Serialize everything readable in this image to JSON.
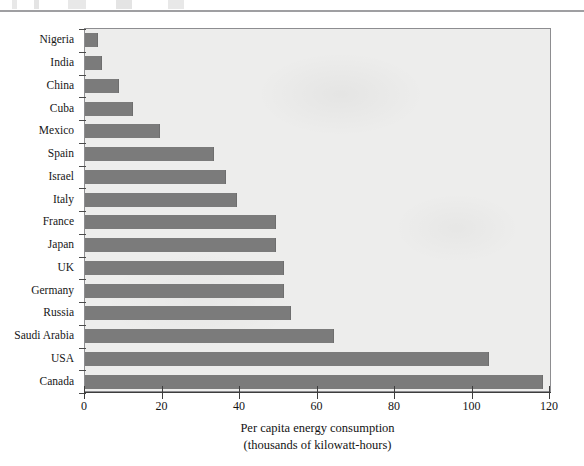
{
  "chart_data": {
    "type": "bar",
    "orientation": "horizontal",
    "title": "",
    "xlabel": "Per capita energy consumption",
    "xlabel_sub": "(thousands of kilowatt-hours)",
    "ylabel": "",
    "xlim": [
      0,
      120
    ],
    "xticks": [
      0,
      20,
      40,
      60,
      80,
      100,
      120
    ],
    "xtick_labels": [
      "0",
      "20",
      "40",
      "60",
      "80",
      "100",
      "120"
    ],
    "grid": false,
    "legend": null,
    "bar_color": "#7b7b7b",
    "plot_background": "#ededec",
    "categories": [
      "Nigeria",
      "India",
      "China",
      "Cuba",
      "Mexico",
      "Spain",
      "Israel",
      "Italy",
      "France",
      "Japan",
      "UK",
      "Germany",
      "Russia",
      "Saudi Arabia",
      "USA",
      "Canada"
    ],
    "values": [
      3,
      4,
      8.5,
      12,
      19,
      33,
      36,
      39,
      49,
      49,
      51,
      51,
      53,
      64,
      104,
      118
    ]
  }
}
